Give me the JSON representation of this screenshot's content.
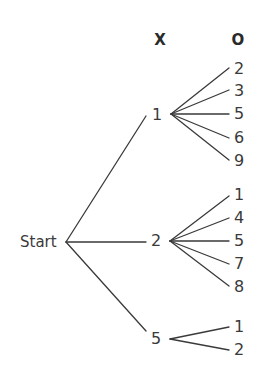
{
  "diagram": {
    "type": "tree",
    "headers": {
      "first_level": "X",
      "second_level": "O"
    },
    "root": {
      "label": "Start"
    },
    "branches": [
      {
        "label": "1",
        "children": [
          "2",
          "3",
          "5",
          "6",
          "9"
        ]
      },
      {
        "label": "2",
        "children": [
          "1",
          "4",
          "5",
          "7",
          "8"
        ]
      },
      {
        "label": "5",
        "children": [
          "1",
          "2"
        ]
      }
    ],
    "line_color": "#3a3a3a",
    "text_color": "#3a3a3a"
  }
}
